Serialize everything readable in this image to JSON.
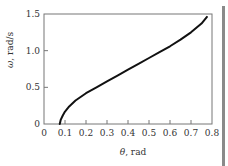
{
  "chart_data": {
    "type": "line",
    "title": "",
    "xlabel": "θ, rad",
    "ylabel": "ω, rad/s",
    "xlim": [
      0,
      0.8
    ],
    "ylim": [
      0,
      1.5
    ],
    "grid": false,
    "legend": null,
    "x_ticks": [
      "0",
      "0.1",
      "0.2",
      "0.3",
      "0.4",
      "0.5",
      "0.6",
      "0.7",
      "0.8"
    ],
    "y_ticks": [
      "0",
      "0.5",
      "1.0",
      "1.5"
    ],
    "series": [
      {
        "name": "ω vs θ",
        "color": "#111111",
        "x": [
          0.075,
          0.08,
          0.09,
          0.1,
          0.12,
          0.15,
          0.2,
          0.25,
          0.3,
          0.35,
          0.4,
          0.45,
          0.5,
          0.55,
          0.6,
          0.65,
          0.7,
          0.75,
          0.776
        ],
        "y": [
          0.0,
          0.06,
          0.12,
          0.17,
          0.24,
          0.32,
          0.42,
          0.5,
          0.58,
          0.66,
          0.74,
          0.82,
          0.9,
          0.98,
          1.06,
          1.15,
          1.25,
          1.37,
          1.46
        ]
      }
    ]
  },
  "labels": {
    "x_axis": {
      "prefix": "θ",
      "suffix": ", rad"
    },
    "y_axis": {
      "prefix": "ω",
      "suffix": ", rad/s"
    }
  },
  "colors": {
    "axis": "#777777",
    "curve": "#111111",
    "text": "#333333"
  }
}
